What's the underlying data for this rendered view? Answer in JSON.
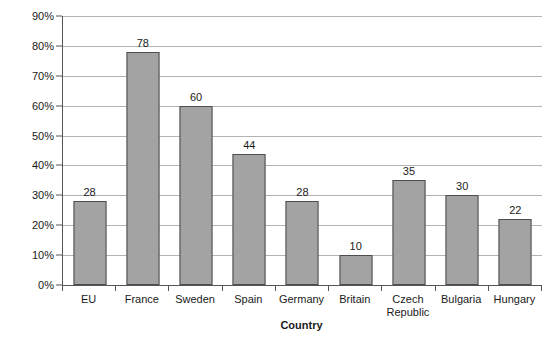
{
  "chart_data": {
    "type": "bar",
    "title": "",
    "xlabel": "Country",
    "ylabel": "% of energy used",
    "categories": [
      "EU",
      "France",
      "Sweden",
      "Spain",
      "Germany",
      "Britain",
      "Czech Republic",
      "Bulgaria",
      "Hungary"
    ],
    "values": [
      28,
      78,
      60,
      44,
      28,
      10,
      35,
      30,
      22
    ],
    "data_labels": [
      "28",
      "78",
      "60",
      "44",
      "28",
      "10",
      "35",
      "30",
      "22"
    ],
    "ylim": [
      0,
      90
    ],
    "ytick_labels": [
      "0%",
      "10%",
      "20%",
      "30%",
      "40%",
      "50%",
      "60%",
      "70%",
      "80%",
      "90%"
    ],
    "ytick_values": [
      0,
      10,
      20,
      30,
      40,
      50,
      60,
      70,
      80,
      90
    ],
    "grid": "horizontal",
    "legend": "none",
    "bar_color": "#a3a3a3",
    "bar_border_color": "#4d4d4d",
    "gridline_color": "#b3b3b3",
    "axis_color": "#555555",
    "background_color": "#ffffff"
  }
}
